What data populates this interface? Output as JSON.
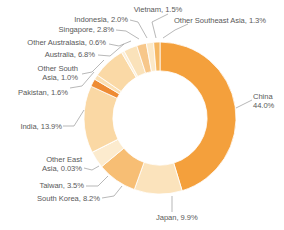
{
  "chart_data": {
    "type": "pie",
    "variant": "donut",
    "title": "",
    "subtitle": "",
    "xlabel": "",
    "ylabel": "",
    "value_unit": "%",
    "legend_position": "none",
    "grid": false,
    "labels_outside": true,
    "leader_lines": true,
    "start_angle_deg": 0,
    "direction": "clockwise",
    "inner_radius_ratio": 0.62,
    "categories": [
      "China",
      "Japan",
      "South Korea",
      "Taiwan",
      "Other East Asia",
      "India",
      "Pakistan",
      "Other South Asia",
      "Australia",
      "Other Australasia",
      "Singapore",
      "Indonesia",
      "Vietnam",
      "Other Southeast Asia"
    ],
    "values": [
      44.0,
      9.9,
      8.2,
      3.5,
      0.03,
      13.9,
      1.6,
      1.0,
      6.8,
      0.6,
      2.8,
      2.0,
      1.5,
      1.3
    ],
    "colors": [
      "#F4A03C",
      "#FBE3BC",
      "#F7BE74",
      "#FCEBCE",
      "#F8C98E",
      "#FAD8A4",
      "#EE8B33",
      "#FBE0B4",
      "#FAD9A6",
      "#FCEFD8",
      "#FAE2BA",
      "#F7C membership",
      "#FCE9C8",
      "#F6B863"
    ],
    "slices": [
      {
        "label": "China",
        "value": 44.0,
        "display": "China\n44.0%",
        "color": "#F4A03C"
      },
      {
        "label": "Japan",
        "value": 9.9,
        "display": "Japan, 9.9%",
        "color": "#FBE3BC"
      },
      {
        "label": "South Korea",
        "value": 8.2,
        "display": "South Korea, 8.2%",
        "color": "#F7BE74"
      },
      {
        "label": "Taiwan",
        "value": 3.5,
        "display": "Taiwan, 3.5%",
        "color": "#FCEBCE"
      },
      {
        "label": "Other East Asia",
        "value": 0.03,
        "display": "Other East Asia, 0.03%",
        "color": "#F8C98E"
      },
      {
        "label": "India",
        "value": 13.9,
        "display": "India, 13.9%",
        "color": "#FAD8A4"
      },
      {
        "label": "Pakistan",
        "value": 1.6,
        "display": "Pakistan, 1.6%",
        "color": "#EE8B33"
      },
      {
        "label": "Other South Asia",
        "value": 1.0,
        "display": "Other South Asia, 1.0%",
        "color": "#FBE0B4"
      },
      {
        "label": "Australia",
        "value": 6.8,
        "display": "Australia, 6.8%",
        "color": "#FAD9A6"
      },
      {
        "label": "Other Australasia",
        "value": 0.6,
        "display": "Other Australasia, 0.6%",
        "color": "#FCEFD8"
      },
      {
        "label": "Singapore",
        "value": 2.8,
        "display": "Singapore, 2.8%",
        "color": "#FAE2BA"
      },
      {
        "label": "Indonesia",
        "value": 2.0,
        "display": "Indonesia, 2.0%",
        "color": "#F7C78A"
      },
      {
        "label": "Vietnam",
        "value": 1.5,
        "display": "Vietnam, 1.5%",
        "color": "#FCE9C8"
      },
      {
        "label": "Other Southeast Asia",
        "value": 1.3,
        "display": "Other Southeast Asia, 1.3%",
        "color": "#F6B863"
      }
    ]
  },
  "labels": {
    "vietnam": "Vietnam, 1.5%",
    "other_southeast_asia": "Other Southeast Asia, 1.3%",
    "indonesia": "Indonesia, 2.0%",
    "singapore": "Singapore, 2.8%",
    "other_australasia": "Other Australasia, 0.6%",
    "australia": "Australia, 6.8%",
    "other_south_asia": "Other South\nAsia, 1.0%",
    "other_south_asia_line1": "Other South",
    "other_south_asia_line2": "Asia, 1.0%",
    "pakistan": "Pakistan, 1.6%",
    "india": "India, 13.9%",
    "other_east_asia_line1": "Other East",
    "other_east_asia_line2": "Asia, 0.03%",
    "taiwan": "Taiwan, 3.5%",
    "south_korea": "South Korea, 8.2%",
    "japan": "Japan, 9.9%",
    "china_line1": "China",
    "china_line2": "44.0%"
  },
  "style": {
    "background": "#ffffff",
    "label_color": "#595959",
    "leader_color": "#9a9a9a",
    "accent": "#F4A03C"
  }
}
